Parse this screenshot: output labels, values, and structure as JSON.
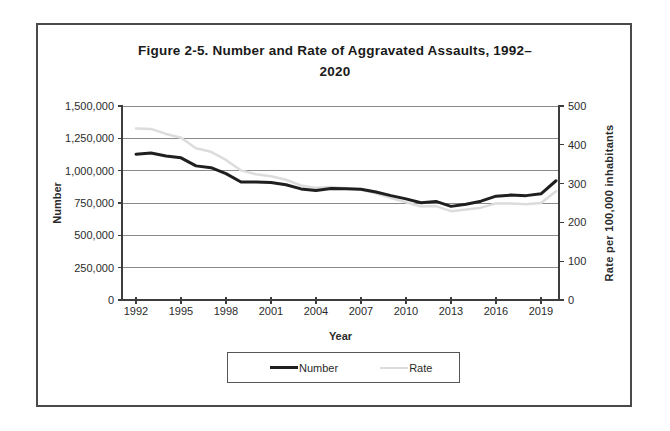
{
  "figure": {
    "title_line1": "Figure 2-5. Number and Rate of Aggravated Assaults, 1992–",
    "title_line2": "2020"
  },
  "axes": {
    "x_title": "Year",
    "y_left_title": "Number",
    "y_right_title": "Rate per 100,000  inhabitants",
    "x_tick_labels": [
      "1992",
      "1995",
      "1998",
      "2001",
      "2004",
      "2007",
      "2010",
      "2013",
      "2016",
      "2019"
    ],
    "y_left_tick_labels": [
      "0",
      "250,000",
      "500,000",
      "750,000",
      "1,000,000",
      "1,250,000",
      "1,500,000"
    ],
    "y_right_tick_labels": [
      "0",
      "100",
      "200",
      "300",
      "400",
      "500"
    ]
  },
  "legend": {
    "number_label": "Number",
    "rate_label": "Rate"
  },
  "colors": {
    "number_line": "#1f1f1f",
    "rate_line": "#dcdcdc",
    "gridline": "#8a8a8a",
    "axis": "#3d3d3d",
    "tick_text": "#2b2b2b",
    "frame_border": "#4a4a4a"
  },
  "chart_data": {
    "type": "line",
    "xlabel": "Year",
    "ylabel_left": "Number",
    "ylabel_right": "Rate per 100,000 inhabitants",
    "x": [
      1992,
      1993,
      1994,
      1995,
      1996,
      1997,
      1998,
      1999,
      2000,
      2001,
      2002,
      2003,
      2004,
      2005,
      2006,
      2007,
      2008,
      2009,
      2010,
      2011,
      2012,
      2013,
      2014,
      2015,
      2016,
      2017,
      2018,
      2019,
      2020
    ],
    "series": [
      {
        "name": "Number",
        "axis": "left",
        "color": "#1f1f1f",
        "values": [
          1127000,
          1136000,
          1113000,
          1099000,
          1037000,
          1023000,
          977000,
          912000,
          912000,
          909000,
          891000,
          859000,
          847000,
          862000,
          861000,
          856000,
          835000,
          807000,
          782000,
          752000,
          762000,
          724000,
          741000,
          764000,
          803000,
          811000,
          807000,
          821000,
          922000
        ]
      },
      {
        "name": "Rate",
        "axis": "right",
        "color": "#dcdcdc",
        "values": [
          442,
          441,
          428,
          418,
          391,
          382,
          361,
          334,
          324,
          319,
          310,
          295,
          289,
          291,
          288,
          284,
          275,
          263,
          252,
          241,
          242,
          229,
          233,
          238,
          249,
          249,
          247,
          250,
          280
        ]
      }
    ],
    "ylim_left": [
      0,
      1500000
    ],
    "ylim_right": [
      0,
      500
    ],
    "x_tick_interval": 3,
    "grid": "horizontal",
    "legend_position": "bottom"
  }
}
